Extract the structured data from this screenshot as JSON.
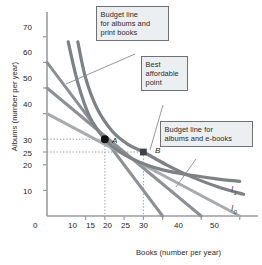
{
  "figure": {
    "kind": "economics-indifference-curve-diagram"
  },
  "chart_data": {
    "type": "line",
    "title": "",
    "xlabel": "Books (number per year)",
    "ylabel": "Albums (number per year)",
    "xlim": [
      0,
      55
    ],
    "ylim": [
      0,
      75
    ],
    "grid": false,
    "legend_position": "inline-right",
    "xticks": [
      0,
      10,
      15,
      20,
      25,
      30,
      40,
      50
    ],
    "xticklabels": [
      "0",
      "10",
      "15",
      "20",
      "25",
      "30",
      "40",
      "50"
    ],
    "yticks": [
      10,
      20,
      25,
      30,
      40,
      50,
      60,
      70
    ],
    "yticklabels": [
      "10",
      "20",
      "25",
      "30",
      "40",
      "50",
      "60",
      "70"
    ],
    "series": [
      {
        "name": "budget-line-print-books",
        "kind": "budget-line",
        "style": "straight",
        "color": "#8d9094",
        "x": [
          0,
          30
        ],
        "y": [
          60,
          0
        ]
      },
      {
        "name": "budget-line-e-books",
        "kind": "budget-line",
        "style": "straight",
        "color": "#8d9094",
        "x": [
          0,
          40
        ],
        "y": [
          50,
          0
        ]
      },
      {
        "name": "budget-line-third",
        "kind": "budget-line",
        "style": "straight",
        "color": "#a8abad",
        "x": [
          0,
          50
        ],
        "y": [
          40,
          0
        ]
      },
      {
        "name": "indifference-curve-I1",
        "kind": "indifference-curve",
        "label": "I",
        "label_sub": "1",
        "style": "convex",
        "color": "#7e8285",
        "x": [
          5.5,
          8,
          11,
          15,
          19,
          24,
          30,
          37,
          44,
          50
        ],
        "y": [
          68,
          52,
          39,
          30,
          25,
          21,
          18,
          16,
          14.5,
          13.5
        ]
      },
      {
        "name": "indifference-curve-I0",
        "kind": "indifference-curve",
        "label": "I",
        "label_sub": "0",
        "style": "convex",
        "color": "#7e8285",
        "x": [
          8,
          10,
          13,
          17,
          21,
          25,
          31,
          38,
          45,
          51
        ],
        "y": [
          68,
          54,
          42,
          33,
          28,
          25,
          20,
          15,
          11,
          8.5
        ]
      }
    ],
    "points": [
      {
        "name": "point-A",
        "label": "A",
        "x": 15,
        "y": 30,
        "color": "#111111",
        "marker": "filled-circle"
      },
      {
        "name": "point-B",
        "label": "B",
        "x": 25,
        "y": 25,
        "color": "#3f4346",
        "marker": "filled-square"
      }
    ],
    "guide_lines": [
      {
        "name": "guide-A-horizontal",
        "from": [
          0,
          30
        ],
        "to": [
          15,
          30
        ],
        "style": "dotted"
      },
      {
        "name": "guide-A-vertical",
        "from": [
          15,
          30
        ],
        "to": [
          15,
          0
        ],
        "style": "dotted"
      },
      {
        "name": "guide-B-horizontal",
        "from": [
          0,
          25
        ],
        "to": [
          25,
          25
        ],
        "style": "dotted"
      },
      {
        "name": "guide-B-vertical",
        "from": [
          25,
          25
        ],
        "to": [
          25,
          0
        ],
        "style": "dotted"
      }
    ],
    "annotations": [
      {
        "name": "callout-budget-print-books",
        "text": "Budget line\nfor albums and\nprint books",
        "points_to": [
          7.5,
          45
        ]
      },
      {
        "name": "callout-best-affordable-point",
        "text": "Best\naffordable\npoint",
        "points_to": [
          25,
          25
        ]
      },
      {
        "name": "callout-budget-e-books",
        "text": "Budget line for\nalbums and e-books",
        "points_to": [
          33,
          13
        ]
      }
    ]
  },
  "axes": {
    "x": {
      "title": "Books (number per year)",
      "ticks": [
        "0",
        "10",
        "15",
        "20",
        "25",
        "30",
        "40",
        "50"
      ]
    },
    "y": {
      "title": "Albums (number per year)",
      "ticks": [
        "70",
        "60",
        "50",
        "40",
        "30",
        "25",
        "20",
        "10"
      ]
    }
  },
  "callouts": {
    "budget_print": "Budget line\nfor albums and\nprint books",
    "best_point": "Best\naffordable\npoint",
    "budget_ebooks": "Budget line for\nalbums and e-books"
  },
  "labels": {
    "point_a": "A",
    "point_b": "B",
    "curve_i1": "I",
    "curve_i1_sub": "1",
    "curve_i0": "I",
    "curve_i0_sub": "0"
  },
  "colors": {
    "budget_line": "#8d9094",
    "budget_line_light": "#a8abad",
    "indifference_curve": "#7e8285",
    "axis": "#9a9da0",
    "point_a": "#111111",
    "point_b": "#3f4346",
    "callout_bg": "#eceff1",
    "callout_border": "#6e7276",
    "text": "#262626"
  }
}
